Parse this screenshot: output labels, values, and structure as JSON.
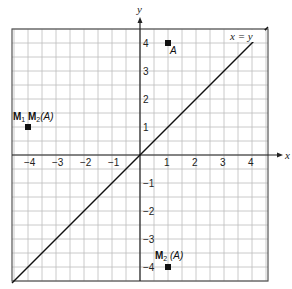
{
  "chart_data": {
    "type": "scatter",
    "title": "",
    "xlabel": "x",
    "ylabel": "y",
    "xlim": [
      -4.6,
      4.6
    ],
    "ylim": [
      -4.5,
      4.5
    ],
    "grid": true,
    "grid_step": 0.5,
    "x_ticks": [
      "−4",
      "−3",
      "−2",
      "−1",
      "1",
      "2",
      "3",
      "4"
    ],
    "y_ticks": [
      "4",
      "3",
      "2",
      "1",
      "−1",
      "−2",
      "−3",
      "−4"
    ],
    "line": {
      "label": "x = y",
      "equation": "y = x"
    },
    "points": [
      {
        "label": "A",
        "x": 1,
        "y": 4
      },
      {
        "label": "M1 M2(A)",
        "x": -4,
        "y": 1
      },
      {
        "label": "M2 (A)",
        "x": 1,
        "y": -4
      }
    ]
  },
  "labels": {
    "x_axis": "x",
    "y_axis": "y",
    "line": "x = y",
    "point_a": "A",
    "point_m1m2_a": "M",
    "point_m1m2_sub1": "1",
    "point_m1m2_b": " M",
    "point_m1m2_sub2": "2",
    "point_m1m2_c": "(A)",
    "point_m2_a": "M",
    "point_m2_sub": "2",
    "point_m2_c": " (A)"
  }
}
